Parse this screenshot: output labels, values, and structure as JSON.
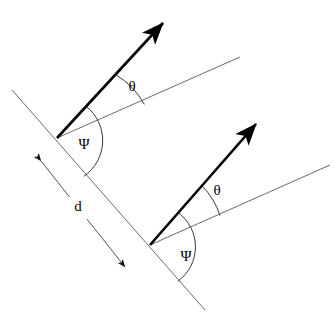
{
  "figure": {
    "background_color": "#ffffff",
    "canvas": {
      "width": 335,
      "height": 323
    },
    "stroke_colors": {
      "thick_vector": "#000000",
      "thin_reference_line": "#555555",
      "plane_line": "#666666",
      "arc": "#333333",
      "spacing_arrow": "#555555",
      "label": "#000000"
    },
    "labels": {
      "theta_upper": "θ",
      "theta_lower": "θ",
      "psi_upper": "Ψ",
      "psi_lower": "Ψ",
      "spacing": "d"
    },
    "label_positions": {
      "theta_upper": {
        "x": 132,
        "y": 88
      },
      "theta_lower": {
        "x": 217,
        "y": 192
      },
      "psi_upper": {
        "x": 84,
        "y": 146
      },
      "psi_lower": {
        "x": 186,
        "y": 258
      },
      "spacing": {
        "x": 78,
        "y": 208
      }
    },
    "geometry": {
      "upper_vertex": {
        "x": 57,
        "y": 138
      },
      "lower_vertex": {
        "x": 150,
        "y": 245
      },
      "upper_vector_tip": {
        "x": 168,
        "y": 18
      },
      "lower_vector_tip": {
        "x": 261,
        "y": 119
      },
      "upper_reference_end": {
        "x": 240,
        "y": 57
      },
      "lower_reference_end": {
        "x": 330,
        "y": 165
      },
      "plane_line_start": {
        "x": 12,
        "y": 90
      },
      "plane_line_end": {
        "x": 205,
        "y": 310
      },
      "spacing_arrow_start": {
        "x": 36,
        "y": 156
      },
      "spacing_arrow_end": {
        "x": 130,
        "y": 273
      }
    },
    "angles_degrees": {
      "theta": 25,
      "psi": 48
    }
  }
}
